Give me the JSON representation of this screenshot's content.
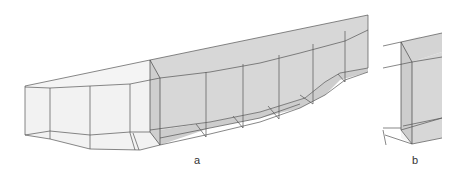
{
  "figure": {
    "panels": [
      {
        "id": "a",
        "label": "a",
        "description": "Perspective wireframe of a segmented box-girder bridge span with shaded cross-section face"
      },
      {
        "id": "b",
        "label": "b",
        "description": "Close-up of the cross-section end of the girder"
      }
    ],
    "colors": {
      "line": "#555555",
      "shade": "#d4d4d4",
      "light_face": "#f2f2f2",
      "background": "#ffffff"
    }
  }
}
